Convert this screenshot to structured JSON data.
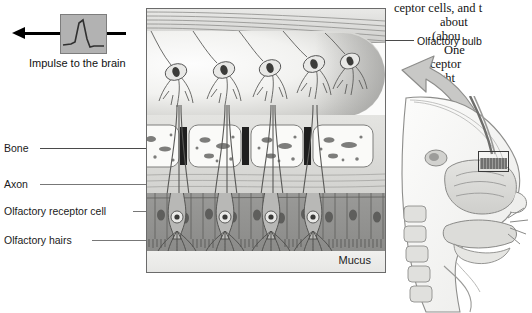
{
  "figure": {
    "panel_border_color": "#6b6b6b"
  },
  "impulse": {
    "label": "Impulse to the brain",
    "waveform_name": "action-potential-spike",
    "box_fill": "#b2b2b2",
    "arrow_color": "#000000",
    "arrow_direction": "left"
  },
  "labels": {
    "bone": "Bone",
    "axon": "Axon",
    "receptor_cell": "Olfactory receptor cell",
    "hairs": "Olfactory hairs",
    "mucus": "Mucus",
    "olfactory_bulb": "Olfactory bulb"
  },
  "body_text": {
    "lines": [
      "ceptor cells, and t",
      "about",
      "(abou",
      "One",
      "ceptor",
      "eight"
    ]
  },
  "head_diagram": {
    "name": "sagittal-head-section",
    "focus_box_label": "olfactory-epithelium-region",
    "callout_arrow": "curved-arrow-up-left"
  },
  "colors": {
    "epithelium": "#8b8b89",
    "bone": "#d3d3d0",
    "bulb_highlight": "#fdfdfd",
    "text": "#131313"
  }
}
